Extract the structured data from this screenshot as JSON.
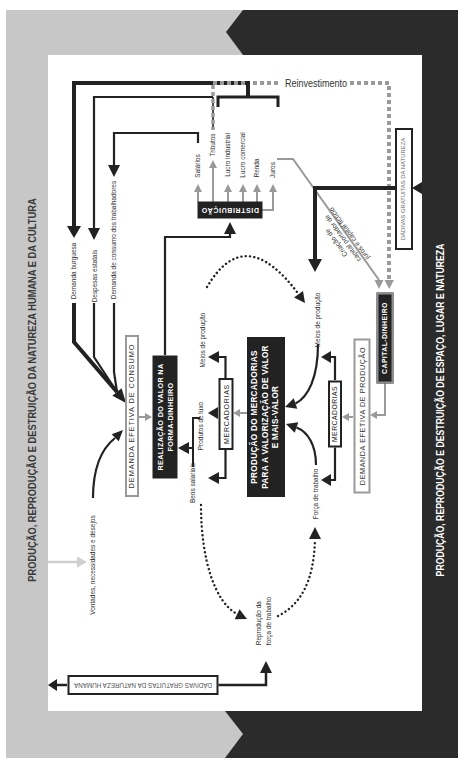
{
  "colors": {
    "band_gray": "#c7c7c7",
    "band_black": "#2b2b2b",
    "box_black": "#222222",
    "arrow_gray": "#9a9a9a",
    "light_arrow": "#cfcfcf",
    "text_dark": "#333333"
  },
  "bands": {
    "left": "PRODUÇÃO, REPRODUÇÃO E DESTRUIÇÃO DA NATUREZA HUMANA E DA CULTURA",
    "right": "PRODUÇÃO, REPRODUÇÃO E DESTRUIÇÃO DE ESPAÇO, LUGAR E NATUREZA"
  },
  "boxes": {
    "dadivas_natureza_humana": "DÁDIVAS GRATUITAS DA NATUREZA HUMANA",
    "dadivas_natureza": "DÁDIVAS GRATUITAS DA NATUREZA",
    "demanda_consumo": "DEMANDA EFETIVA DE CONSUMO",
    "realizacao": [
      "REALIZAÇÃO DO VALOR NA",
      "FORMA-DINHEIRO"
    ],
    "mercadorias_distribuicao": "MERCADORIAS",
    "producao": [
      "PRODUÇÃO DO MERCADORIAS",
      "PARA A VALORIZAÇÃO DE VALOR",
      "E MAIS-VALOR"
    ],
    "mercadorias_producao": "MERCADORIAS",
    "demanda_producao": "DEMANDA EFETIVA DE PRODUÇÃO",
    "capital_dinheiro": "CAPITAL-DINHEIRO",
    "distribuicao": "DISTRIBUIÇÃO"
  },
  "labels": {
    "reinvestimento": "Reinvestimento",
    "demanda_burguesa": "Demanda burguesa",
    "despesas_estatais": "Despesas estatais",
    "demanda_trabalhadores": "Demanda de consumo dos trabalhadores",
    "salarios": "Salários",
    "tributos": "Tributos",
    "lucro_industrial": "Lucro industrial",
    "lucro_comercial": "Lucro comercial",
    "renda": "Renda",
    "juros": "Juros",
    "criacao_capital": [
      "Criação de",
      "capital portador de",
      "juros e capital fictício"
    ],
    "meios_producao_distribuicao": "Meios de produção",
    "produtos_luxo": "Produtos de luxo",
    "bens_salariais": "Bens salariais",
    "meios_producao_producao": "Meios de produção",
    "forca_trabalho": "Força de trabalho",
    "reproducao": [
      "Reprodução da",
      "força de trabalho"
    ],
    "vontades": "Vontades, necessidades e desejos"
  }
}
